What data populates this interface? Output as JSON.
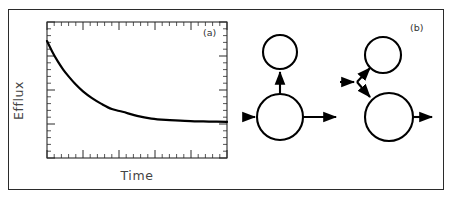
{
  "figure": {
    "width": 452,
    "height": 200,
    "background": "#ffffff",
    "frame_color": "#2b2b2b",
    "ink_color": "#000000"
  },
  "panel_a": {
    "tag": "(a)",
    "xlabel": "Time",
    "ylabel": "Efflux",
    "plot_box": {
      "left": 47,
      "top": 22,
      "right": 227,
      "bottom": 158
    },
    "axes": {
      "ticks_top": true,
      "ticks_bottom": true,
      "ticks_left": true,
      "ticks_right": true,
      "tick_labels_x": [],
      "tick_labels_y": [],
      "major_ticks_x": 5,
      "minor_ticks_per_major_x": 5,
      "major_ticks_y": 4,
      "minor_ticks_per_major_y": 5
    }
  },
  "panel_b": {
    "tag": "(b)",
    "diagram_left": {
      "name": "single-compartment-model",
      "nodes": [
        {
          "id": "upper-small-circle",
          "cx": 280,
          "cy": 52,
          "r": 17
        },
        {
          "id": "lower-large-circle",
          "cx": 280,
          "cy": 117,
          "r": 23
        }
      ],
      "arrows": [
        {
          "id": "inflow-arrow",
          "from": [
            243,
            117
          ],
          "to": [
            256,
            117
          ],
          "direction": "right"
        },
        {
          "id": "vertical-up-arrow",
          "from": [
            280,
            94
          ],
          "to": [
            280,
            70
          ],
          "direction": "up"
        },
        {
          "id": "outflow-arrow",
          "from": [
            303,
            117
          ],
          "to": [
            338,
            117
          ],
          "direction": "right"
        }
      ]
    },
    "diagram_right": {
      "name": "branched-two-compartment-model",
      "nodes": [
        {
          "id": "upper-small-circle",
          "cx": 383,
          "cy": 55,
          "r": 18
        },
        {
          "id": "lower-large-circle",
          "cx": 389,
          "cy": 117,
          "r": 24
        }
      ],
      "arrows": [
        {
          "id": "inflow-arrow",
          "from": [
            340,
            82
          ],
          "to": [
            356,
            82
          ],
          "direction": "right"
        },
        {
          "id": "branch-up-arrow",
          "from": [
            357,
            82
          ],
          "to": [
            370,
            68
          ],
          "direction": "up-right"
        },
        {
          "id": "branch-down-arrow",
          "from": [
            357,
            82
          ],
          "to": [
            371,
            98
          ],
          "direction": "down-right"
        },
        {
          "id": "outflow-arrow",
          "from": [
            413,
            117
          ],
          "to": [
            434,
            117
          ],
          "direction": "right"
        }
      ]
    }
  },
  "chart_data": {
    "type": "line",
    "title": "",
    "xlabel": "Time",
    "ylabel": "Efflux",
    "legend": [],
    "grid": false,
    "axis_ticks_unlabeled": true,
    "xlim": [
      0,
      1
    ],
    "ylim": [
      0,
      1
    ],
    "series": [
      {
        "name": "efflux-decay",
        "color": "#000000",
        "linewidth": 2.2,
        "description": "monotonic exponential decay approaching a non-zero plateau",
        "x": [
          0.0,
          0.03,
          0.06,
          0.09,
          0.12,
          0.16,
          0.2,
          0.25,
          0.3,
          0.36,
          0.42,
          0.5,
          0.58,
          0.66,
          0.74,
          0.82,
          0.9,
          1.0
        ],
        "y": [
          0.86,
          0.78,
          0.71,
          0.65,
          0.6,
          0.54,
          0.49,
          0.44,
          0.4,
          0.36,
          0.34,
          0.31,
          0.29,
          0.28,
          0.275,
          0.27,
          0.268,
          0.265
        ]
      }
    ]
  }
}
